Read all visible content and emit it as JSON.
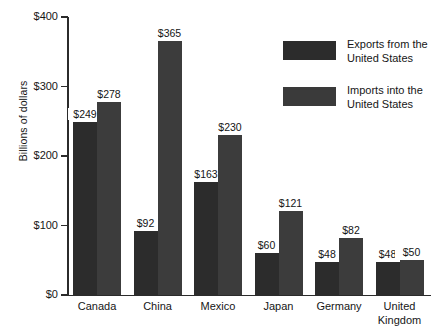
{
  "chart_data": {
    "type": "bar",
    "title": "",
    "xlabel": "",
    "ylabel": "Billions of dollars",
    "ylim": [
      0,
      400
    ],
    "ytick_values": [
      400,
      300,
      200,
      100,
      0
    ],
    "ytick_labels": [
      "$400",
      "$300",
      "$200",
      "$100",
      "$0"
    ],
    "grid": false,
    "legend_position": "upper right",
    "categories": [
      "Canada",
      "China",
      "Mexico",
      "Japan",
      "Germany",
      "United\nKingdom"
    ],
    "series": [
      {
        "name": "Exports from the\nUnited States",
        "color": "#2c2c2c",
        "values": [
          249,
          92,
          163,
          60,
          48,
          48
        ],
        "labels": [
          "$249",
          "$92",
          "$163",
          "$60",
          "$48",
          "$48"
        ]
      },
      {
        "name": "Imports into the\nUnited States",
        "color": "#3c3c3c",
        "values": [
          278,
          365,
          230,
          121,
          82,
          50
        ],
        "labels": [
          "$278",
          "$365",
          "$230",
          "$121",
          "$82",
          "$50"
        ]
      }
    ]
  },
  "axes": {
    "y_title": "Billions of dollars",
    "y_ticks": [
      {
        "label": "$400",
        "value": 400
      },
      {
        "label": "$300",
        "value": 300
      },
      {
        "label": "$200",
        "value": 200
      },
      {
        "label": "$100",
        "value": 100
      },
      {
        "label": "$0",
        "value": 0
      }
    ]
  },
  "legend": {
    "items": [
      {
        "label": "Exports from the\nUnited States",
        "color": "#2c2c2c"
      },
      {
        "label": "Imports into the\nUnited States",
        "color": "#3a3a3a"
      }
    ]
  }
}
